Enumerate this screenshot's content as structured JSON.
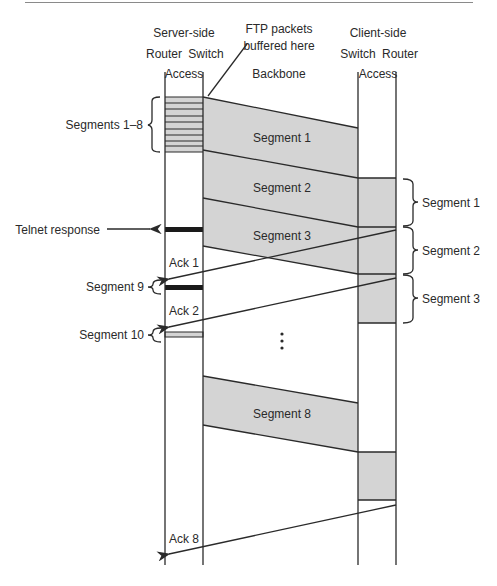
{
  "header": {
    "server_side": "Server-side",
    "client_side": "Client-side",
    "server_router": "Router",
    "server_switch": "Switch",
    "client_switch": "Switch",
    "client_router": "Router",
    "server_access": "Access",
    "client_access": "Access",
    "backbone": "Backbone",
    "ftp_note_line1": "FTP packets",
    "ftp_note_line2": "buffered here"
  },
  "left_labels": {
    "segments_1_8": "Segments 1–8",
    "telnet_response": "Telnet response",
    "segment_9": "Segment 9",
    "segment_10": "Segment 10"
  },
  "bands": {
    "seg1": "Segment 1",
    "seg2": "Segment 2",
    "seg3": "Segment 3",
    "seg8": "Segment 8"
  },
  "acks": {
    "ack1": "Ack 1",
    "ack2": "Ack 2",
    "ack8": "Ack 8"
  },
  "right_labels": {
    "seg1": "Segment 1",
    "seg2": "Segment 2",
    "seg3": "Segment 3"
  },
  "ellipsis": "⋮",
  "colors": {
    "band_fill": "#d4d4d4",
    "line": "#2a2a2a",
    "telnet_bar": "#1a1a1a"
  }
}
